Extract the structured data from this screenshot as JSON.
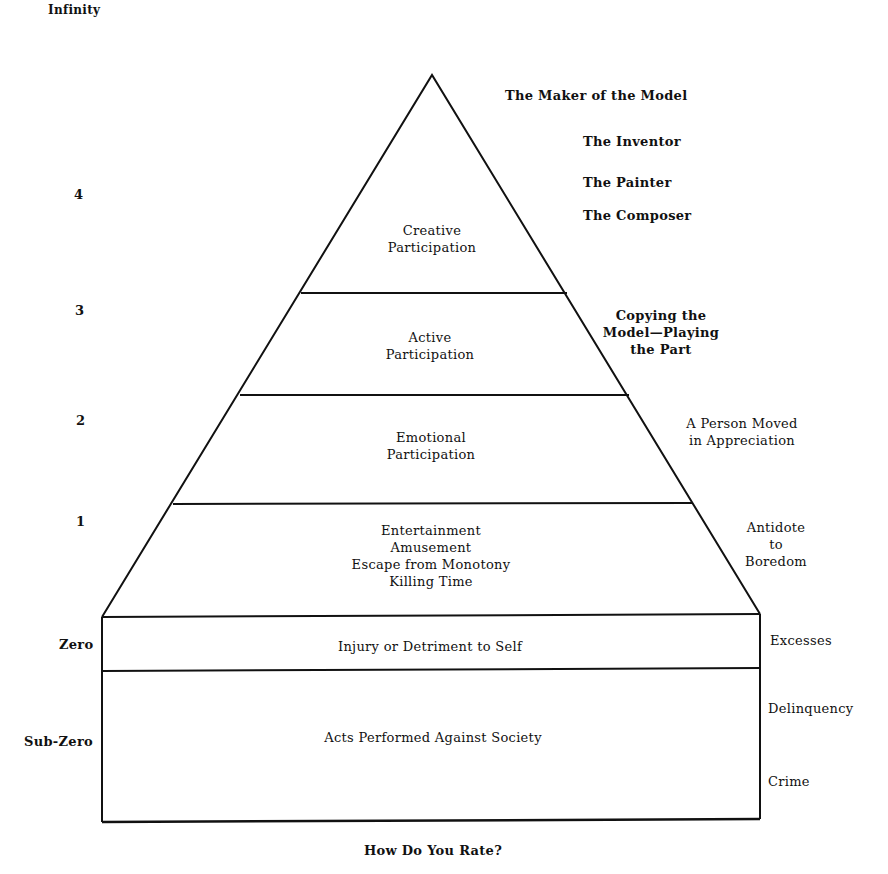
{
  "scale_labels": {
    "infinity": "Infinity",
    "four": "4",
    "three": "3",
    "two": "2",
    "one": "1",
    "zero": "Zero",
    "sub_zero": "Sub-Zero"
  },
  "pyramid_levels": {
    "creative": "Creative\nParticipation",
    "active": "Active\nParticipation",
    "emotional": "Emotional\nParticipation",
    "entertainment": "Entertainment\nAmusement\nEscape from Monotony\nKilling Time",
    "injury": "Injury or Detriment to Self",
    "acts_against_society": "Acts Performed Against Society"
  },
  "right_annotations": {
    "maker": "The Maker of the Model",
    "inventor": "The Inventor",
    "painter": "The Painter",
    "composer": "The Composer",
    "copying": "Copying the\nModel—Playing\nthe Part",
    "person_moved": "A Person Moved\nin Appreciation",
    "antidote": "Antidote\nto\nBoredom",
    "excesses": "Excesses",
    "delinquency": "Delinquency",
    "crime": "Crime"
  },
  "caption": "How Do You Rate?",
  "colors": {
    "line": "#111111",
    "background": "#ffffff"
  }
}
